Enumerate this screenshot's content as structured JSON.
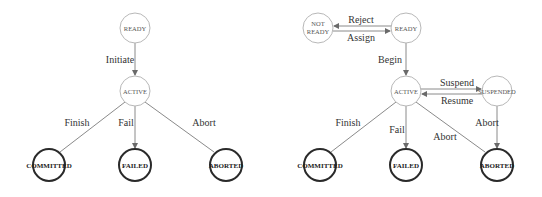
{
  "diagrams": [
    {
      "name": "basic-transaction-states",
      "states": {
        "ready": "READY",
        "active": "ACTIVE",
        "committed": "COMMITTED",
        "failed": "FAILED",
        "aborted": "ABORTED"
      },
      "transitions": {
        "initiate": "Initiate",
        "finish": "Finish",
        "fail": "Fail",
        "abort": "Abort"
      }
    },
    {
      "name": "extended-transaction-states",
      "states": {
        "not_ready_line1": "NOT",
        "not_ready_line2": "READY",
        "ready": "READY",
        "active": "ACTIVE",
        "suspended": "SUSPENDED",
        "committed": "COMMITTED",
        "failed": "FAILED",
        "aborted": "ABORTED"
      },
      "transitions": {
        "reject": "Reject",
        "assign": "Assign",
        "begin": "Begin",
        "suspend": "Suspend",
        "resume": "Resume",
        "finish": "Finish",
        "fail": "Fail",
        "abort_from_active": "Abort",
        "abort_from_suspended": "Abort"
      }
    }
  ]
}
